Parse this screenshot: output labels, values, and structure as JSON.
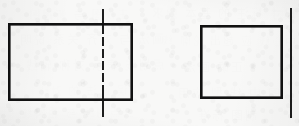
{
  "document": {
    "kind": "scanned-engineering-drawing",
    "media": "paper-scan",
    "width_px": 299,
    "height_px": 126,
    "paper_color": "#f8f8f7",
    "ink_color": "#111111",
    "caption": ""
  },
  "ghost_bleedthrough": {
    "description": "faint reversed text showing through from the opposite side of the scanned page",
    "lines": [
      {
        "text": "主视图 与 俯视图",
        "x": 28,
        "y": 6,
        "size": 11,
        "rotate": -0.8,
        "opacity": 0.1
      },
      {
        "text": "尺寸 标注 的 基本 要求",
        "x": 150,
        "y": 4,
        "size": 12,
        "rotate": 0.5,
        "opacity": 0.11
      },
      {
        "text": "画法 与 对齐 关系 说明",
        "x": 18,
        "y": 30,
        "size": 12,
        "rotate": -0.4,
        "opacity": 0.1
      },
      {
        "text": "中心线 应 超出 轮廓 线",
        "x": 160,
        "y": 32,
        "size": 11,
        "rotate": 0.6,
        "opacity": 0.09
      },
      {
        "text": "点划线 表示 对称 轴线",
        "x": 24,
        "y": 56,
        "size": 12,
        "rotate": -0.5,
        "opacity": 0.1
      },
      {
        "text": "正确 画法",
        "x": 182,
        "y": 58,
        "size": 12,
        "rotate": 0.3,
        "opacity": 0.11
      },
      {
        "text": "错误 画法 的 对比",
        "x": 36,
        "y": 82,
        "size": 11,
        "rotate": -0.6,
        "opacity": 0.09
      },
      {
        "text": "图 中 线 型 应用",
        "x": 176,
        "y": 84,
        "size": 12,
        "rotate": 0.4,
        "opacity": 0.1
      },
      {
        "text": "细点划线 与 粗实线",
        "x": 20,
        "y": 104,
        "size": 11,
        "rotate": -0.3,
        "opacity": 0.09
      },
      {
        "text": "制图 标准",
        "x": 196,
        "y": 106,
        "size": 12,
        "rotate": 0.5,
        "opacity": 0.1
      }
    ]
  },
  "figure": {
    "title": "",
    "stroke_color": "#111111",
    "outline_stroke_width": 2.6,
    "centerline_stroke_width": 1.9,
    "shapes": [
      {
        "id": "left-rectangle",
        "type": "rectangle",
        "role": "outline-contour",
        "x": 8,
        "y": 23,
        "width": 125,
        "height": 78,
        "stroke_width": 2.6,
        "fill": "none"
      },
      {
        "id": "left-centerline",
        "type": "vertical-line",
        "role": "axis-of-symmetry",
        "line_style": "dash-dot-inside-solid-outside",
        "x": 103,
        "y_top": 9,
        "y_bottom": 117,
        "stroke_width": 1.9,
        "segments_solid": [
          {
            "y1": 9,
            "y2": 24
          },
          {
            "y1": 100,
            "y2": 117
          }
        ],
        "segments_broken": [
          {
            "y1": 25,
            "y2": 34
          },
          {
            "y1": 37,
            "y2": 46
          },
          {
            "y1": 49,
            "y2": 58
          },
          {
            "y1": 61,
            "y2": 70
          },
          {
            "y1": 73,
            "y2": 82
          },
          {
            "y1": 85,
            "y2": 99
          }
        ]
      },
      {
        "id": "right-rectangle",
        "type": "rectangle",
        "role": "outline-contour",
        "x": 200,
        "y": 25,
        "width": 83,
        "height": 74,
        "stroke_width": 2.6,
        "fill": "none"
      },
      {
        "id": "right-edge-centerline",
        "type": "vertical-line",
        "role": "axis-line-cropped-at-page-edge",
        "line_style": "solid",
        "x": 291,
        "y_top": 8,
        "y_bottom": 118,
        "stroke_width": 1.9
      }
    ]
  }
}
